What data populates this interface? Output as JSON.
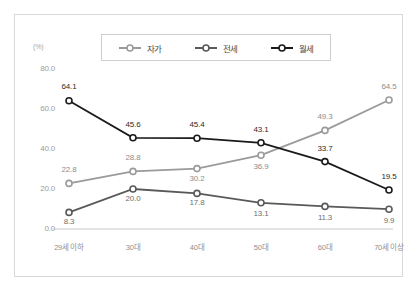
{
  "chart_data": {
    "type": "line",
    "title": "",
    "xlabel": "",
    "ylabel": "",
    "unit_label": "(%)",
    "categories": [
      "29세 이하",
      "30대",
      "40대",
      "50대",
      "60대",
      "70세 이상"
    ],
    "yticks": [
      "0.0",
      "20.0",
      "40.0",
      "60.0",
      "80.0"
    ],
    "ylim": [
      0,
      80
    ],
    "grid": false,
    "legend_position": "top-center",
    "series": [
      {
        "name": "자가",
        "color": "#9a9a9a",
        "values": [
          22.8,
          28.8,
          30.2,
          36.9,
          49.3,
          64.5
        ],
        "labels": [
          "22.8",
          "28.8",
          "30.2",
          "36.9",
          "49.3",
          "64.5"
        ]
      },
      {
        "name": "전세",
        "color": "#595959",
        "values": [
          8.3,
          20.0,
          17.8,
          13.1,
          11.3,
          9.9
        ],
        "labels": [
          "8.3",
          "20.0",
          "17.8",
          "13.1",
          "11.3",
          "9.9"
        ]
      },
      {
        "name": "월세",
        "color": "#1a1a1a",
        "values": [
          64.1,
          45.6,
          45.4,
          43.1,
          33.7,
          19.5
        ],
        "labels": [
          "64.1",
          "45.6",
          "45.4",
          "43.1",
          "33.7",
          "19.5"
        ]
      }
    ]
  }
}
